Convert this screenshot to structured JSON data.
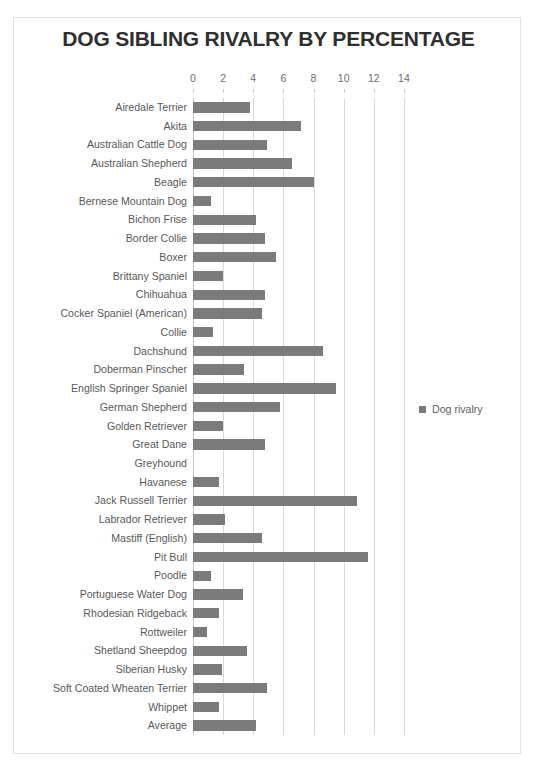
{
  "page": {
    "background_color": "#ffffff",
    "frame_color": "#e2e2e2"
  },
  "chart_data": {
    "type": "bar",
    "orientation": "horizontal",
    "title": "DOG SIBLING RIVALRY BY PERCENTAGE",
    "xlabel": "",
    "ylabel": "",
    "xlim": [
      0,
      14.8
    ],
    "xticks": [
      0,
      2,
      4,
      6,
      8,
      10,
      12,
      14
    ],
    "xtick_labels": [
      "0",
      "2",
      "4",
      "6",
      "8",
      "10",
      "12",
      "14"
    ],
    "grid": "vertical",
    "legend_position": "right",
    "series_name": "Dog rivalry",
    "bar_color": "#7b7b7b",
    "categories": [
      "Airedale Terrier",
      "Akita",
      "Australian Cattle Dog",
      "Australian Shepherd",
      "Beagle",
      "Bernese Mountain Dog",
      "Bichon Frise",
      "Border Collie",
      "Boxer",
      "Brittany Spaniel",
      "Chihuahua",
      "Cocker Spaniel (American)",
      "Collie",
      "Dachshund",
      "Doberman Pinscher",
      "English Springer Spaniel",
      "German Shepherd",
      "Golden Retriever",
      "Great Dane",
      "Greyhound",
      "Havanese",
      "Jack Russell Terrier",
      "Labrador Retriever",
      "Mastiff (English)",
      "Pit Bull",
      "Poodle",
      "Portuguese Water Dog",
      "Rhodesian Ridgeback",
      "Rottweiler",
      "Shetland Sheepdog",
      "Siberian Husky",
      "Soft Coated Wheaten Terrier",
      "Whippet",
      "Average"
    ],
    "values": [
      3.8,
      7.2,
      4.9,
      6.6,
      8.0,
      1.2,
      4.2,
      4.8,
      5.5,
      2.0,
      4.8,
      4.6,
      1.3,
      8.6,
      3.4,
      9.5,
      5.8,
      2.0,
      4.8,
      0.0,
      1.7,
      10.9,
      2.1,
      4.6,
      11.6,
      1.2,
      3.3,
      1.7,
      0.9,
      3.6,
      1.9,
      4.9,
      1.7,
      4.2
    ]
  },
  "legend": {
    "label": "Dog rivalry",
    "swatch_color": "#7b7b7b"
  }
}
